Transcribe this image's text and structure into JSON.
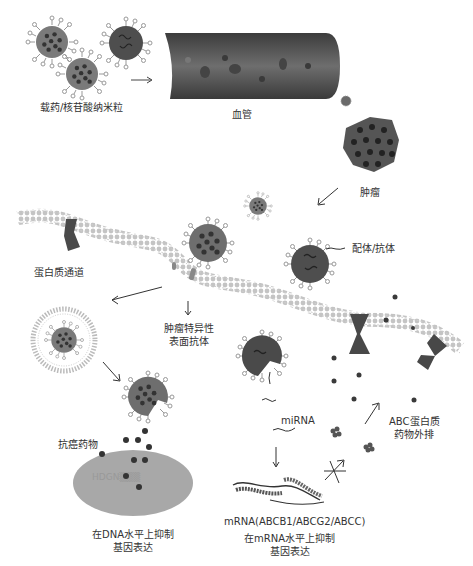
{
  "labels": {
    "nanoparticle": "载药/核苷酸纳米粒",
    "blood_vessel": "血管",
    "tumor": "肿瘤",
    "ligand_antibody": "配体/抗体",
    "protein_channel": "蛋白质通道",
    "tumor_antigen_line1": "肿瘤特异性",
    "tumor_antigen_line2": "表面抗体",
    "abc_line1": "ABC蛋白质",
    "abc_line2": "药物外排",
    "anticancer_drug": "抗癌药物",
    "mirna": "miRNA",
    "mrna": "mRNA(ABCB1/ABCG2/ABCC)",
    "dna_inhibit_line1": "在DNA水平上抑制",
    "dna_inhibit_line2": "基因表达",
    "mrna_inhibit_line1": "在mRNA水平上抑制",
    "mrna_inhibit_line2": "基因表达"
  },
  "colors": {
    "particle_body": "#7a7a7a",
    "particle_dark": "#4a4a4a",
    "drug_dot": "#3a3a3a",
    "membrane": "#bdbdbd",
    "nucleus": "#a8a8a8",
    "vessel": "#5a5a5a"
  }
}
